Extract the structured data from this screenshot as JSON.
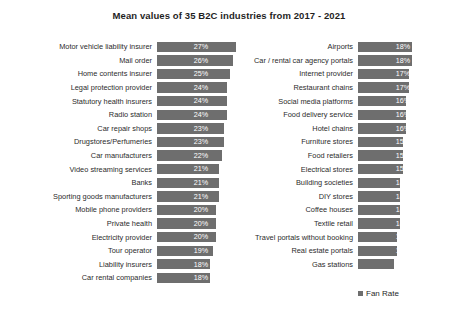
{
  "chart_data": {
    "type": "bar",
    "title": "Mean values of 35 B2C industries from 2017 - 2021",
    "xlabel": "",
    "ylabel": "",
    "orientation": "horizontal",
    "grid": false,
    "legend": {
      "position": "bottom-right",
      "entries": [
        "Fan Rate"
      ]
    },
    "value_suffix": "%",
    "xlim": [
      0,
      30
    ],
    "series": [
      {
        "name": "Fan Rate",
        "color": "#6e6e6e",
        "categories": [
          "Motor vehicle liability insurer",
          "Mail order",
          "Home contents insurer",
          "Legal protection provider",
          "Statutory health insurers",
          "Radio station",
          "Car repair shops",
          "Drugstores/Perfumeries",
          "Car manufacturers",
          "Video streaming services",
          "Banks",
          "Sporting goods manufacturers",
          "Mobile phone providers",
          "Private health",
          "Electricity provider",
          "Tour operator",
          "Liability insurers",
          "Car rental companies",
          "Airports",
          "Car / rental car agency portals",
          "Internet provider",
          "Restaurant chains",
          "Social media platforms",
          "Food delivery service",
          "Hotel chains",
          "Furniture stores",
          "Food retailers",
          "Electrical stores",
          "Building societies",
          "DIY stores",
          "Coffee houses",
          "Textile retail",
          "Travel portals without booking",
          "Real estate portals",
          "Gas stations"
        ],
        "values": [
          27,
          26,
          25,
          24,
          24,
          24,
          23,
          23,
          22,
          21,
          21,
          21,
          20,
          20,
          20,
          19,
          18,
          18,
          18,
          18,
          17,
          17,
          16,
          16,
          16,
          15,
          15,
          15,
          14,
          14,
          14,
          14,
          13,
          13,
          12
        ]
      }
    ]
  },
  "columns": {
    "left": [
      {
        "label": "Motor vehicle liability insurer",
        "value": 27,
        "value_text": "27%"
      },
      {
        "label": "Mail order",
        "value": 26,
        "value_text": "26%"
      },
      {
        "label": "Home contents insurer",
        "value": 25,
        "value_text": "25%"
      },
      {
        "label": "Legal protection provider",
        "value": 24,
        "value_text": "24%"
      },
      {
        "label": "Statutory health insurers",
        "value": 24,
        "value_text": "24%"
      },
      {
        "label": "Radio station",
        "value": 24,
        "value_text": "24%"
      },
      {
        "label": "Car repair shops",
        "value": 23,
        "value_text": "23%"
      },
      {
        "label": "Drugstores/Perfumeries",
        "value": 23,
        "value_text": "23%"
      },
      {
        "label": "Car manufacturers",
        "value": 22,
        "value_text": "22%"
      },
      {
        "label": "Video streaming services",
        "value": 21,
        "value_text": "21%"
      },
      {
        "label": "Banks",
        "value": 21,
        "value_text": "21%"
      },
      {
        "label": "Sporting goods manufacturers",
        "value": 21,
        "value_text": "21%"
      },
      {
        "label": "Mobile phone providers",
        "value": 20,
        "value_text": "20%"
      },
      {
        "label": "Private health",
        "value": 20,
        "value_text": "20%"
      },
      {
        "label": "Electricity provider",
        "value": 20,
        "value_text": "20%"
      },
      {
        "label": "Tour operator",
        "value": 19,
        "value_text": "19%"
      },
      {
        "label": "Liability insurers",
        "value": 18,
        "value_text": "18%"
      },
      {
        "label": "Car rental companies",
        "value": 18,
        "value_text": "18%"
      }
    ],
    "right": [
      {
        "label": "Airports",
        "value": 18,
        "value_text": "18%"
      },
      {
        "label": "Car / rental car agency portals",
        "value": 18,
        "value_text": "18%"
      },
      {
        "label": "Internet provider",
        "value": 17,
        "value_text": "17%"
      },
      {
        "label": "Restaurant chains",
        "value": 17,
        "value_text": "17%"
      },
      {
        "label": "Social media platforms",
        "value": 16,
        "value_text": "16%"
      },
      {
        "label": "Food delivery service",
        "value": 16,
        "value_text": "16%"
      },
      {
        "label": "Hotel chains",
        "value": 16,
        "value_text": "16%"
      },
      {
        "label": "Furniture stores",
        "value": 15,
        "value_text": "15%"
      },
      {
        "label": "Food retailers",
        "value": 15,
        "value_text": "15%"
      },
      {
        "label": "Electrical stores",
        "value": 15,
        "value_text": "15%"
      },
      {
        "label": "Building societies",
        "value": 14,
        "value_text": "14%"
      },
      {
        "label": "DIY stores",
        "value": 14,
        "value_text": "14%"
      },
      {
        "label": "Coffee houses",
        "value": 14,
        "value_text": "14%"
      },
      {
        "label": "Textile retail",
        "value": 14,
        "value_text": "14%"
      },
      {
        "label": "Travel portals without booking",
        "value": 13,
        "value_text": "13%"
      },
      {
        "label": "Real estate portals",
        "value": 13,
        "value_text": "13%"
      },
      {
        "label": "Gas stations",
        "value": 12,
        "value_text": "12%"
      }
    ]
  },
  "legend": {
    "label": "Fan Rate"
  },
  "colors": {
    "bar": "#6e6e6e",
    "text": "#2b2b2b",
    "value_text": "#ffffff",
    "background": "#ffffff"
  }
}
